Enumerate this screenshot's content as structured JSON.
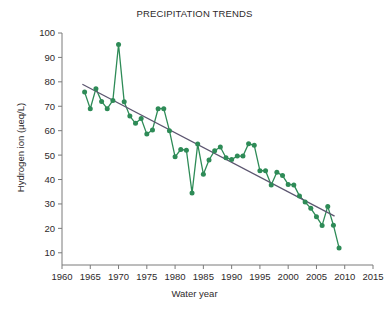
{
  "chart_data": {
    "type": "line",
    "title": "PRECIPITATION TRENDS",
    "xlabel": "Water year",
    "ylabel": "Hydrogen ion (µeq/L)",
    "xlim": [
      1960,
      2015
    ],
    "ylim": [
      5,
      100
    ],
    "xticks": [
      1960,
      1965,
      1970,
      1975,
      1980,
      1985,
      1990,
      1995,
      2000,
      2005,
      2010,
      2015
    ],
    "yticks": [
      10,
      20,
      30,
      40,
      50,
      60,
      70,
      80,
      90,
      100
    ],
    "grid": false,
    "legend": null,
    "marker": "circle",
    "series": [
      {
        "name": "Hydrogen ion concentration",
        "color": "#2e8b57",
        "x": [
          1964,
          1965,
          1966,
          1967,
          1968,
          1969,
          1970,
          1971,
          1972,
          1973,
          1974,
          1975,
          1976,
          1977,
          1978,
          1979,
          1980,
          1981,
          1982,
          1983,
          1984,
          1985,
          1986,
          1987,
          1988,
          1989,
          1990,
          1991,
          1992,
          1993,
          1994,
          1995,
          1996,
          1997,
          1998,
          1999,
          2000,
          2001,
          2002,
          2003,
          2004,
          2005,
          2006,
          2007,
          2008,
          2009
        ],
        "values": [
          75.8,
          69.0,
          77.2,
          72.0,
          69.0,
          72.4,
          95.3,
          71.8,
          66.0,
          63.0,
          65.0,
          58.6,
          60.3,
          69.0,
          69.0,
          60.0,
          49.3,
          52.3,
          52.0,
          34.5,
          54.5,
          42.2,
          48.0,
          51.8,
          53.3,
          48.9,
          48.2,
          49.6,
          49.6,
          54.7,
          54.0,
          43.6,
          43.6,
          37.8,
          43.0,
          41.6,
          38.0,
          37.8,
          33.3,
          30.8,
          28.2,
          24.8,
          21.2,
          29.0,
          21.3,
          12.0
        ]
      }
    ],
    "trend_line": {
      "name": "Linear trend",
      "color": "#5c5670",
      "x_start": 1963.6,
      "y_start": 79.0,
      "x_end": 2008.2,
      "y_end": 25.0
    }
  }
}
